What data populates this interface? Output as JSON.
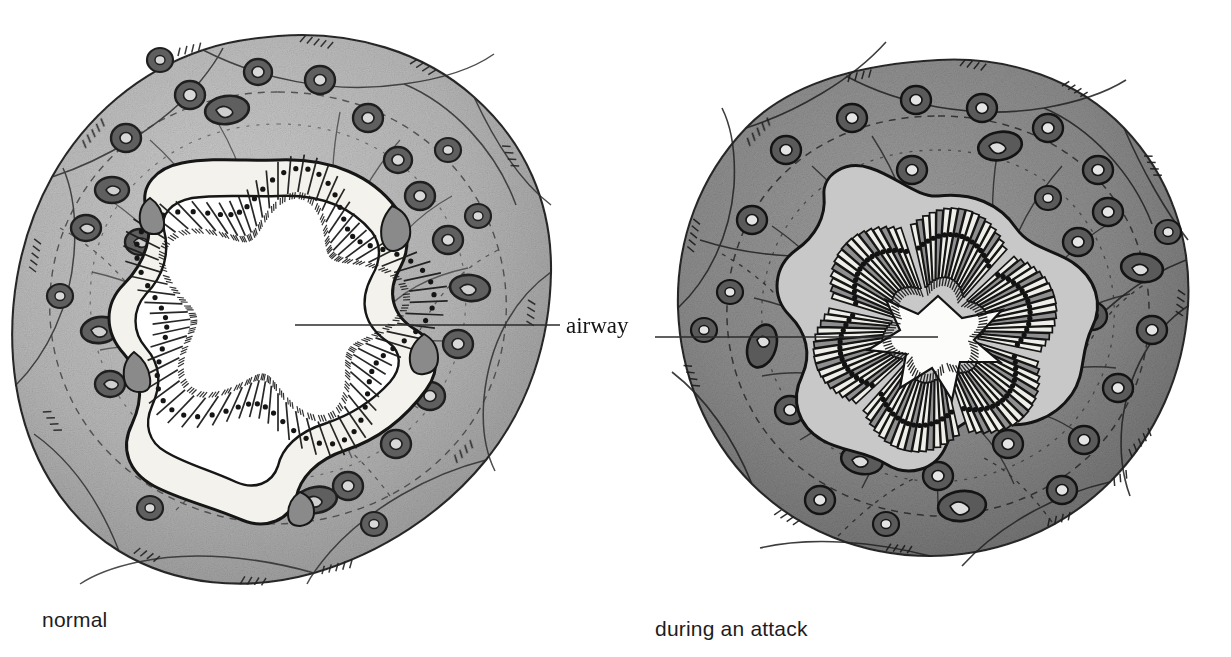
{
  "figure": {
    "title_visible": false,
    "background": "#ffffff",
    "ink": "#1a1a1a"
  },
  "labels": {
    "airway": "airway",
    "normal": "normal",
    "attack": "during an attack"
  },
  "leader_lines": [
    {
      "name": "leader-left",
      "x1": 295,
      "y1": 325,
      "x2": 560,
      "y2": 325
    },
    {
      "name": "leader-right",
      "x1": 655,
      "y1": 337,
      "x2": 938,
      "y2": 337
    }
  ],
  "palette": {
    "wall_normal": "#b9b9b9",
    "wall_attack": "#8e8e8e",
    "wall_outer_normal": "#a6a6a6",
    "wall_outer_attack": "#7d7d7d",
    "gland_ring": "#6f6f6f",
    "gland_dark": "#3c3c3c",
    "epithelium_cell": "#f2f0ea",
    "epithelium_cell_dark": "#8c8c8c",
    "lumen": "#ffffff",
    "lumen_attack": "#f7f7f5",
    "outline": "#1d1d1d"
  },
  "panels": [
    {
      "id": "normal",
      "caption": "normal",
      "center": {
        "x": 278,
        "y": 308
      },
      "outer_radius": 272,
      "wall_fill": "#b9b9b9",
      "lumen_shape": "open-stellate",
      "lumen_radius": 122,
      "epithelium_cells": 74,
      "gland_count": 30,
      "muscle_bands": 9,
      "state": "relaxed smooth muscle, wide open lumen"
    },
    {
      "id": "attack",
      "caption": "during an attack",
      "center": {
        "x": 935,
        "y": 330
      },
      "outer_radius": 268,
      "wall_fill": "#8e8e8e",
      "lumen_shape": "constricted-star",
      "lumen_radius": 46,
      "epithelium_cells": 96,
      "gland_count": 32,
      "muscle_bands": 11,
      "state": "constricted smooth muscle, folded mucosa, narrow lumen"
    }
  ],
  "chart_data": {
    "type": "diagram",
    "panels": [
      "normal",
      "during an attack"
    ],
    "annotations": [
      "airway"
    ]
  }
}
